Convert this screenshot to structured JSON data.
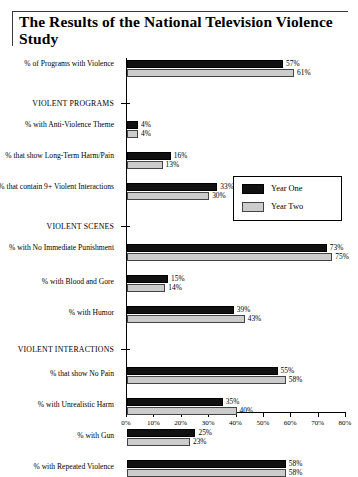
{
  "title": "The Results of the National Television Violence Study",
  "legend": {
    "position": "inside-upper-right",
    "items": [
      {
        "label": "Year One",
        "color": "#111111"
      },
      {
        "label": "Year Two",
        "color": "#cccccc"
      }
    ]
  },
  "axis": {
    "ticks": [
      "0%",
      "10%",
      "20%",
      "30%",
      "40%",
      "50%",
      "60%",
      "70%",
      "80%"
    ],
    "min": 0,
    "max": 80
  },
  "sections": [
    {
      "label": "VIOLENT PROGRAMS"
    },
    {
      "label": "VIOLENT SCENES"
    },
    {
      "label": "VIOLENT INTERACTIONS"
    }
  ],
  "rows": [
    {
      "label": "% of Programs with Violence",
      "y1": "57%",
      "y2": "61%"
    },
    {
      "label": "% with Anti-Violence Theme",
      "y1": "4%",
      "y2": "4%"
    },
    {
      "label": "% that show Long-Term Harm/Pain",
      "y1": "16%",
      "y2": "13%"
    },
    {
      "label": "% that contain 9+ Violent Interactions",
      "y1": "33%",
      "y2": "30%"
    },
    {
      "label": "% with No Immediate Punishment",
      "y1": "73%",
      "y2": "75%"
    },
    {
      "label": "% with Blood and Gore",
      "y1": "15%",
      "y2": "14%"
    },
    {
      "label": "% with Humor",
      "y1": "39%",
      "y2": "43%"
    },
    {
      "label": "% that show No Pain",
      "y1": "55%",
      "y2": "58%"
    },
    {
      "label": "% with Unrealistic Harm",
      "y1": "35%",
      "y2": "40%"
    },
    {
      "label": "% with Gun",
      "y1": "25%",
      "y2": "23%"
    },
    {
      "label": "% with Repeated Violence",
      "y1": "58%",
      "y2": "58%"
    }
  ],
  "chart_data": {
    "type": "bar",
    "orientation": "horizontal",
    "title": "The Results of the National Television Violence Study",
    "xlabel": "",
    "ylabel": "",
    "xlim": [
      0,
      80
    ],
    "xticks": [
      0,
      10,
      20,
      30,
      40,
      50,
      60,
      70,
      80
    ],
    "xtick_labels": [
      "0%",
      "10%",
      "20%",
      "30%",
      "40%",
      "50%",
      "60%",
      "70%",
      "80%"
    ],
    "grid": false,
    "legend": [
      "Year One",
      "Year Two"
    ],
    "legend_position": "upper right (inside)",
    "categories": [
      "% of Programs with Violence",
      "% with Anti-Violence Theme",
      "% that show Long-Term Harm/Pain",
      "% that contain 9+ Violent Interactions",
      "% with No Immediate Punishment",
      "% with Blood and Gore",
      "% with Humor",
      "% that show No Pain",
      "% with Unrealistic Harm",
      "% with Gun",
      "% with Repeated Violence"
    ],
    "group_headers": [
      {
        "label": "VIOLENT PROGRAMS",
        "after_category_index": 0
      },
      {
        "label": "VIOLENT SCENES",
        "after_category_index": 3
      },
      {
        "label": "VIOLENT INTERACTIONS",
        "after_category_index": 6
      }
    ],
    "series": [
      {
        "name": "Year One",
        "color": "#111111",
        "values": [
          57,
          4,
          16,
          33,
          73,
          15,
          39,
          55,
          35,
          25,
          58
        ]
      },
      {
        "name": "Year Two",
        "color": "#cccccc",
        "values": [
          61,
          4,
          13,
          30,
          75,
          14,
          43,
          58,
          40,
          23,
          58
        ]
      }
    ]
  }
}
